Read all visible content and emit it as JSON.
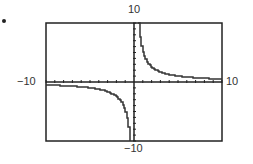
{
  "labels": {
    "y_max": "10",
    "y_min": "−10",
    "x_min": "−10",
    "x_max": "10"
  },
  "colors": {
    "frame": "#222222",
    "curve": "#333333",
    "axis": "#222222"
  },
  "chart_data": {
    "type": "line",
    "title": "",
    "xlabel": "",
    "ylabel": "",
    "xlim": [
      -10,
      10
    ],
    "ylim": [
      -10,
      10
    ],
    "grid": false,
    "x_ticks_every": 1,
    "y_ticks_every": 1,
    "legend": null,
    "series": [
      {
        "name": "y = 5/x (approx, calculator graph of rational function)",
        "x": [
          -10,
          -8,
          -6,
          -5,
          -4,
          -3,
          -2,
          -1.5,
          -1,
          -0.8,
          -0.6,
          -0.5
        ],
        "y": [
          -0.5,
          -0.63,
          -0.83,
          -1,
          -1.25,
          -1.67,
          -2.5,
          -3.33,
          -5,
          -6.25,
          -8.33,
          -10
        ]
      },
      {
        "name": "y = 5/x (approx, right branch)",
        "x": [
          0.5,
          0.6,
          0.8,
          1,
          1.5,
          2,
          3,
          4,
          5,
          6,
          8,
          10
        ],
        "y": [
          10,
          8.33,
          6.25,
          5,
          3.33,
          2.5,
          1.67,
          1.25,
          1,
          0.83,
          0.63,
          0.5
        ]
      }
    ],
    "annotations": [
      "vertical asymptote at x = 0",
      "horizontal asymptote at y = 0"
    ]
  }
}
